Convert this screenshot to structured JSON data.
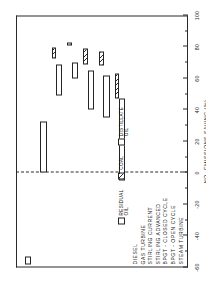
{
  "chart_data": {
    "type": "bar",
    "subtype": "floating-range-bar",
    "title": "",
    "orientation": "vertical-bars-on-rotated-page",
    "xlabel": "",
    "ylabel": "NOx EMISSIONS SAVING (%)",
    "ylim": [
      -60,
      100
    ],
    "y_major_step": 20,
    "y_minor_step": 10,
    "tick_labels": [
      "-60",
      "-40",
      "-20",
      "0",
      "20",
      "40",
      "60",
      "80",
      "100"
    ],
    "tick_values": [
      -60,
      -40,
      -20,
      0,
      20,
      40,
      60,
      80,
      100
    ],
    "grid": false,
    "zero_reference_line": 0,
    "legend_position": "inside-lower-left",
    "categories": [
      "DIESEL",
      "GAS TURBINE",
      "STIRLING CURRENT",
      "STIRLING ADVANCED",
      "BPGT - CLOSED CYCLE",
      "BPGT - OPEN CYCLE",
      "STEAM TURBINE"
    ],
    "series": [
      {
        "name": "RESIDUAL OIL / DISTILLATE OIL",
        "fill": "open",
        "ranges": [
          {
            "category": "DIESEL",
            "low": -58,
            "high": -53
          },
          {
            "category": "GAS TURBINE",
            "low": 0,
            "high": 33
          },
          {
            "category": "STIRLING CURRENT",
            "low": 49,
            "high": 69
          },
          {
            "category": "STIRLING ADVANCED",
            "low": 60,
            "high": 70
          },
          {
            "category": "BPGT - CLOSED CYCLE",
            "low": 40,
            "high": 65
          },
          {
            "category": "BPGT - OPEN CYCLE",
            "low": 35,
            "high": 62
          },
          {
            "category": "STEAM TURBINE",
            "low": -5,
            "high": 47
          }
        ]
      },
      {
        "name": "COAL",
        "fill": "hatched",
        "ranges": [
          {
            "category": "DIESEL",
            "low": null,
            "high": null
          },
          {
            "category": "GAS TURBINE",
            "low": null,
            "high": null
          },
          {
            "category": "STIRLING CURRENT",
            "low": 73,
            "high": 80
          },
          {
            "category": "STIRLING ADVANCED",
            "low": 81,
            "high": 83
          },
          {
            "category": "BPGT - CLOSED CYCLE",
            "low": 69,
            "high": 79
          },
          {
            "category": "BPGT - OPEN CYCLE",
            "low": 68,
            "high": 77
          },
          {
            "category": "STEAM TURBINE",
            "low": 47,
            "high": 63
          }
        ]
      }
    ],
    "legend": [
      {
        "label": "RESIDUAL\nOIL",
        "swatch": "open"
      },
      {
        "label": "COAL",
        "swatch": "hatched"
      },
      {
        "label": "DISTILLATE\nOIL",
        "swatch": "open"
      }
    ],
    "colors": {
      "ink": "#242424",
      "background": "#ffffff"
    }
  }
}
